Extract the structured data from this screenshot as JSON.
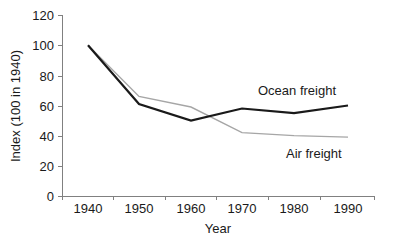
{
  "chart_data": {
    "type": "line",
    "title": "",
    "xlabel": "Year",
    "ylabel": "Index (100 in 1940)",
    "categories": [
      "1940",
      "1950",
      "1960",
      "1970",
      "1980",
      "1990"
    ],
    "x": [
      1940,
      1950,
      1960,
      1970,
      1980,
      1990
    ],
    "ylim": [
      0,
      120
    ],
    "yticks": [
      "0",
      "20",
      "40",
      "60",
      "80",
      "100",
      "120"
    ],
    "ytick_values": [
      0,
      20,
      40,
      60,
      80,
      100,
      120
    ],
    "grid": false,
    "legend_position": "inline-annotation",
    "series": [
      {
        "name": "Ocean freight",
        "values": [
          100,
          61,
          50,
          58,
          55,
          60
        ],
        "color": "#1a1a1a",
        "line_width": 2.2,
        "annotation": {
          "text": "Ocean freight",
          "x": 258,
          "y": 95
        }
      },
      {
        "name": "Air freight",
        "values": [
          100,
          66,
          59,
          42,
          40,
          39
        ],
        "color": "#a6a6a6",
        "line_width": 1.4,
        "annotation": {
          "text": "Air freight",
          "x": 286,
          "y": 158
        }
      }
    ]
  },
  "axes": {
    "axis_color": "#808080",
    "x_tick_positions": [
      62,
      113,
      165,
      216,
      268,
      320,
      375
    ],
    "x_label_positions": [
      88,
      139,
      191,
      242,
      294,
      348
    ],
    "plot": {
      "left": 62,
      "right": 375,
      "top": 15,
      "bottom": 196,
      "y_min": 0,
      "y_max": 120
    }
  }
}
